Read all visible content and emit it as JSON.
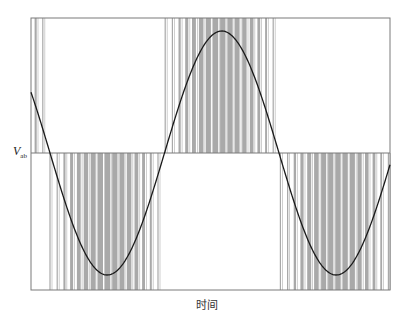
{
  "chart_data": {
    "type": "line",
    "title": "",
    "xlabel": "时间",
    "ylabel": "V",
    "ylabel_subscript": "ab",
    "grid": false,
    "legend": [],
    "frame": {
      "left": 31,
      "top": 18,
      "right": 390,
      "bottom": 290,
      "midline": 153
    },
    "sine": {
      "amplitude_px": 122,
      "period_px": 229,
      "zero_crossing_x": 50,
      "start_sign": "positive-descending",
      "points": [
        {
          "x": 31,
          "y": 98
        },
        {
          "x": 50,
          "y": 153
        },
        {
          "x": 105,
          "y": 276
        },
        {
          "x": 162,
          "y": 153
        },
        {
          "x": 219,
          "y": 31
        },
        {
          "x": 277,
          "y": 153
        },
        {
          "x": 333,
          "y": 274
        },
        {
          "x": 390,
          "y": 150
        }
      ]
    },
    "pwm": {
      "bar_color": "#a9a9a9",
      "carrier_pitch_px": 7.2,
      "segments": [
        {
          "from": 31,
          "to": 50,
          "sign": 1
        },
        {
          "from": 50,
          "to": 162,
          "sign": -1
        },
        {
          "from": 162,
          "to": 277,
          "sign": 1
        },
        {
          "from": 277,
          "to": 390,
          "sign": -1
        }
      ]
    }
  },
  "axis": {
    "y_label_main": "V",
    "y_label_sub": "ab",
    "x_label": "时间"
  },
  "colors": {
    "frame": "#7a7a7a",
    "curve": "#1a1a1a",
    "bars": "#a9a9a9",
    "background": "#ffffff"
  }
}
